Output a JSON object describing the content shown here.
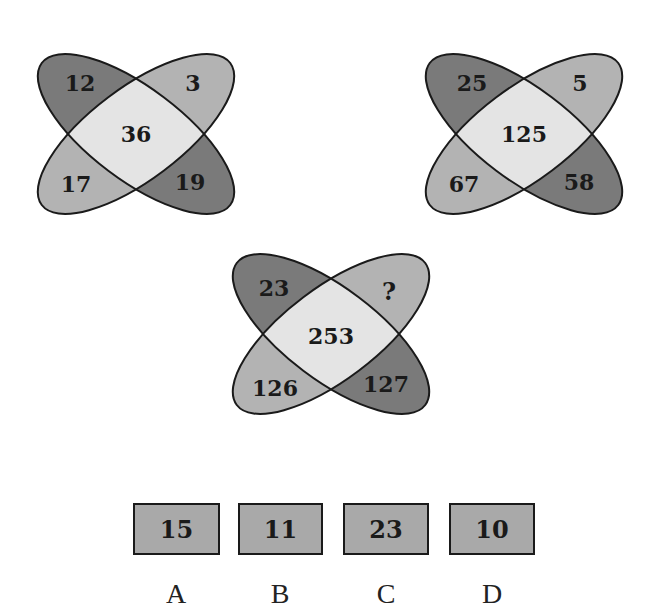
{
  "puzzle": {
    "diagrams": [
      {
        "id": "diagram-1",
        "top_left": "12",
        "top_right": "3",
        "center": "36",
        "bottom_left": "17",
        "bottom_right": "19"
      },
      {
        "id": "diagram-2",
        "top_left": "25",
        "top_right": "5",
        "center": "125",
        "bottom_left": "67",
        "bottom_right": "58"
      },
      {
        "id": "diagram-3",
        "top_left": "23",
        "top_right": "?",
        "center": "253",
        "bottom_left": "126",
        "bottom_right": "127"
      }
    ],
    "options": [
      {
        "letter": "A",
        "value": "15"
      },
      {
        "letter": "B",
        "value": "11"
      },
      {
        "letter": "C",
        "value": "23"
      },
      {
        "letter": "D",
        "value": "10"
      }
    ],
    "colors": {
      "dark_petal": "#7a7a7a",
      "light_petal": "#b3b3b3",
      "center": "#e4e4e4",
      "outline": "#1a1a1a",
      "option_box": "#a9a9a9"
    }
  }
}
